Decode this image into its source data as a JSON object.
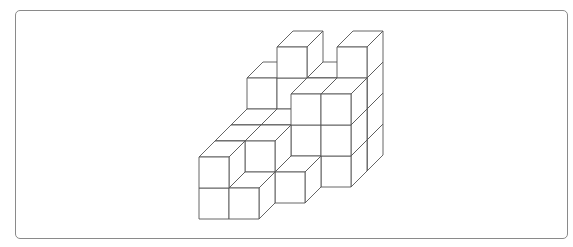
{
  "figure": {
    "title": "",
    "projection": {
      "origin": [
        199,
        219
      ],
      "cube_width": 30,
      "cube_height": 31,
      "depth_dx": 16,
      "depth_dy": -16
    },
    "colors": {
      "stroke": "#555555",
      "fill": "#ffffff",
      "frame": "#8a8a8a"
    },
    "columns": [
      {
        "x": 0,
        "z": 0,
        "height": 2
      },
      {
        "x": 1,
        "z": 0,
        "height": 1
      },
      {
        "x": 0,
        "z": 1,
        "height": 2
      },
      {
        "x": 1,
        "z": 1,
        "height": 2
      },
      {
        "x": 2,
        "z": 1,
        "height": 1
      },
      {
        "x": 0,
        "z": 2,
        "height": 2
      },
      {
        "x": 1,
        "z": 2,
        "height": 2
      },
      {
        "x": 2,
        "z": 2,
        "height": 3
      },
      {
        "x": 3,
        "z": 2,
        "height": 3
      },
      {
        "x": 0,
        "z": 3,
        "height": 3
      },
      {
        "x": 1,
        "z": 3,
        "height": 4
      },
      {
        "x": 2,
        "z": 3,
        "height": 3
      },
      {
        "x": 3,
        "z": 3,
        "height": 4
      }
    ]
  }
}
